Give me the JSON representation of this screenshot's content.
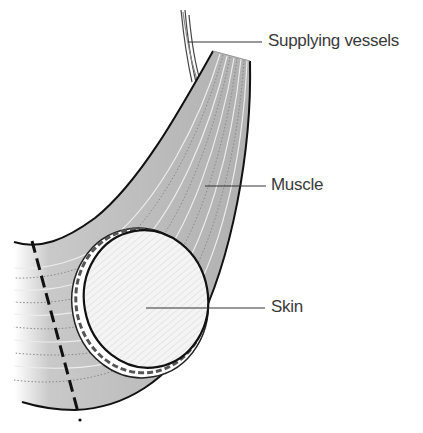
{
  "diagram": {
    "type": "musculocutaneous-flap",
    "labels": {
      "vessels": "Supplying vessels",
      "muscle": "Muscle",
      "skin": "Skin"
    },
    "colors": {
      "muscle_fill": "#b5b5b5",
      "muscle_stripe": "#e6e6e6",
      "skin_fill": "#f4f4f4",
      "outline": "#111111",
      "label_text": "#3a3a3a",
      "leader_line": "#333333"
    }
  }
}
